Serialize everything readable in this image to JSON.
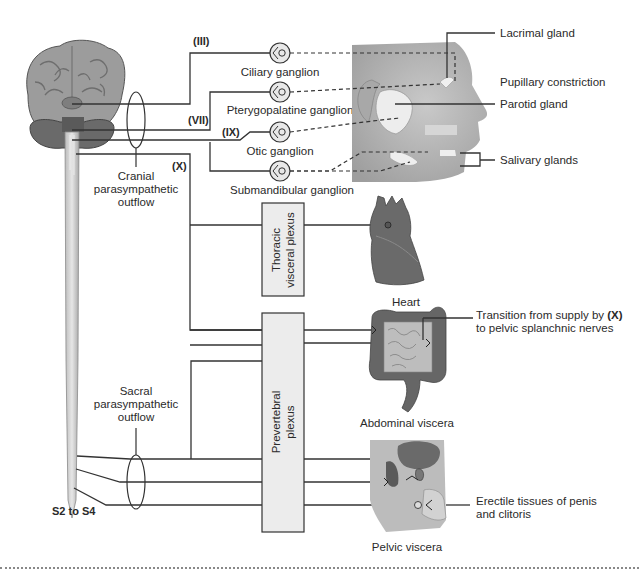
{
  "diagram": {
    "type": "parasympathetic-nervous-system-schematic",
    "cranial_nerves": {
      "III": "(III)",
      "VII": "(VII)",
      "IX": "(IX)",
      "X": "(X)"
    },
    "ganglia": [
      {
        "id": "ciliary",
        "label": "Ciliary ganglion"
      },
      {
        "id": "pterygopalatine",
        "label": "Pterygopalatine ganglion"
      },
      {
        "id": "otic",
        "label": "Otic ganglion"
      },
      {
        "id": "submandibular",
        "label": "Submandibular ganglion"
      }
    ],
    "outflows": {
      "cranial": [
        "Cranial",
        "parasympathetic",
        "outflow"
      ],
      "sacral": [
        "Sacral",
        "parasympathetic",
        "outflow"
      ],
      "sacral_segments": "S2 to S4"
    },
    "plexuses": {
      "thoracic": [
        "Thoracic",
        "visceral plexus"
      ],
      "prevertebral": [
        "Prevertebral",
        "plexus"
      ]
    },
    "head_targets": [
      {
        "id": "lacrimal",
        "label": "Lacrimal gland"
      },
      {
        "id": "pupil",
        "label": "Pupillary constriction"
      },
      {
        "id": "parotid",
        "label": "Parotid gland"
      },
      {
        "id": "salivary",
        "label": "Salivary glands"
      }
    ],
    "organs": {
      "heart": "Heart",
      "abdominal": "Abdominal viscera",
      "pelvic": "Pelvic viscera"
    },
    "annotations": {
      "transition": [
        "Transition from supply by ",
        "(X)",
        "to pelvic splanchnic nerves"
      ],
      "erectile": [
        "Erectile tissues of penis",
        "and clitoris"
      ]
    }
  },
  "colors": {
    "line": "#333333",
    "brain": "#9a9a9a",
    "brainstem": "#6a6a6a",
    "plexus_fill": "#ececec",
    "organ_dark": "#5a5a5a",
    "organ_light": "#c8c8c8"
  }
}
